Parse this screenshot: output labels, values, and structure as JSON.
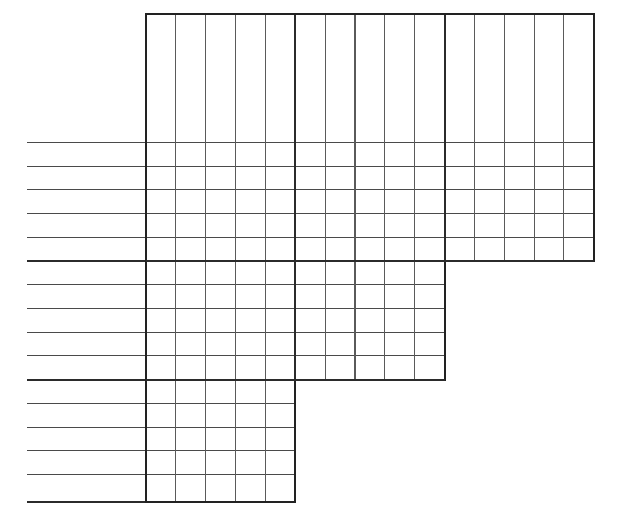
{
  "document": {
    "title": "Blank stepped grid worksheet",
    "type": "line-ruled stepped grid / tally chart template",
    "background_color": "#ffffff",
    "ink_color": "#2b2b2b",
    "minor_line_color": "#5a5a5a",
    "width": 625,
    "height": 527
  },
  "chart_data": {
    "type": "table",
    "title": "",
    "subtitle": "",
    "xlabel": "",
    "ylabel": "",
    "grid": true,
    "legend": false,
    "categories": [],
    "values": [],
    "row_count": 15,
    "column_count": 15,
    "cell_values": []
  },
  "geometry": {
    "margin_left": 27,
    "grid_left": 146,
    "grid_top": 14,
    "grid_right": 594,
    "grid_bottom": 502,
    "column_spacing": 29.85,
    "row_spacing": 23.72,
    "column_x": [
      146,
      175.9,
      205.7,
      235.6,
      265.4,
      295.3,
      325.1,
      355,
      384.8,
      414.7,
      444.5,
      474.4,
      504.2,
      534.1,
      563.9,
      593.8
    ],
    "row_y": [
      14,
      142.5,
      166.2,
      189.9,
      213.6,
      237.3,
      261,
      261,
      284.8,
      308.5,
      332.2,
      355.9,
      379.6,
      379.6,
      403.3,
      427.1,
      450.8,
      474.5,
      498.2,
      502
    ],
    "rule_y": [
      142.5,
      166.2,
      189.9,
      213.6,
      237.3,
      261,
      284.8,
      308.5,
      332.2,
      355.9,
      379.6,
      403.3,
      427.1,
      450.8,
      474.5,
      502
    ],
    "major_column_x": [
      146,
      295.3,
      444.5,
      593.8
    ],
    "major_row_y": [
      261,
      379.6,
      502
    ],
    "blocks": [
      {
        "name": "top-block",
        "top": 14,
        "bottom": 261,
        "left": 146,
        "right": 593.8,
        "columns": 15
      },
      {
        "name": "middle-block",
        "top": 261,
        "bottom": 379.6,
        "left": 146,
        "right": 444.5,
        "columns": 10
      },
      {
        "name": "bottom-block",
        "top": 379.6,
        "bottom": 502,
        "left": 146,
        "right": 295.3,
        "columns": 5
      }
    ]
  },
  "labels": {
    "axis_ticks": [],
    "row_labels": [],
    "column_labels": [],
    "annotations": []
  }
}
